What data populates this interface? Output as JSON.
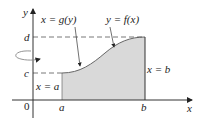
{
  "figure": {
    "axis_labels": {
      "x": "x",
      "y": "y",
      "origin": "0"
    },
    "ticks": {
      "a": "a",
      "b": "b",
      "c": "c",
      "d": "d"
    },
    "curve_labels": {
      "g": "x = g(y)",
      "f": "y = f(x)"
    },
    "boundary_labels": {
      "left": "x = a",
      "right": "x = b"
    },
    "colors": {
      "shade": "#d9d9d9",
      "line": "#333333",
      "curve": "#666666",
      "dash": "#555555"
    },
    "rotation_axis": "y-axis"
  }
}
